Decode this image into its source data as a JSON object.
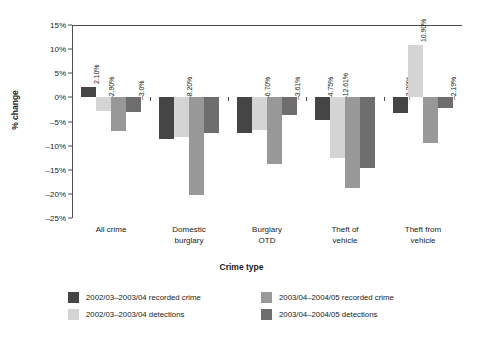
{
  "chart_data": {
    "type": "bar",
    "title": "",
    "xlabel": "Crime type",
    "ylabel": "% change",
    "ylim": [
      -25,
      15
    ],
    "ytick_step": 5,
    "grid": false,
    "legend_position": "bottom",
    "yticks": [
      "15%",
      "10%",
      "5%",
      "0%",
      "-5%",
      "-10%",
      "-15%",
      "-20%",
      "-25%"
    ],
    "categories": [
      "All crime",
      "Domestic burglary",
      "Burglary OTD",
      "Theft of vehicle",
      "Theft from vehicle"
    ],
    "category_lines": [
      [
        "All crime",
        ""
      ],
      [
        "Domestic",
        "burglary"
      ],
      [
        "Burglary",
        "OTD"
      ],
      [
        "Theft of",
        "vehicle"
      ],
      [
        "Theft from",
        "vehicle"
      ]
    ],
    "series": [
      {
        "name": "2002/03-2003/04 recorded crime",
        "color": "#454545",
        "values": [
          2.1,
          -8.6,
          -7.4,
          -4.75,
          -3.2
        ],
        "labels": [
          "2.10%",
          "-8.60%",
          "-7.40%",
          "-4.75%",
          "-3.20%"
        ]
      },
      {
        "name": "2002/03-2003/04 detections",
        "color": "#d4d4d4",
        "values": [
          -2.9,
          -8.2,
          -6.7,
          -12.61,
          10.9
        ],
        "labels": [
          "-2.90%",
          "-8.20%",
          "-6.70%",
          "-12.61%",
          "10.90%"
        ]
      },
      {
        "name": "2003/04-2004/05 recorded crime",
        "color": "#989898",
        "values": [
          -6.95,
          -20.19,
          -13.78,
          -18.76,
          -9.51
        ],
        "labels": [
          "-6.95%",
          "-20.19%",
          "-13.78%",
          "-18.76%",
          "-9.51%"
        ]
      },
      {
        "name": "2003/04-2004/05 detections",
        "color": "#6e6e6e",
        "values": [
          -3.0,
          -7.29,
          -3.61,
          -14.64,
          -2.19
        ],
        "labels": [
          "-3.0%",
          "-7.29%",
          "-3.61%",
          "-14.64%",
          "-2.19%"
        ]
      }
    ],
    "legend": [
      {
        "label": "2002/03–2003/04 recorded crime",
        "color": "#454545"
      },
      {
        "label": "2003/04–2004/05 recorded crime",
        "color": "#989898"
      },
      {
        "label": "2002/03–2003/04 detections",
        "color": "#d4d4d4"
      },
      {
        "label": "2003/04–2004/05 detections",
        "color": "#6e6e6e"
      }
    ]
  }
}
